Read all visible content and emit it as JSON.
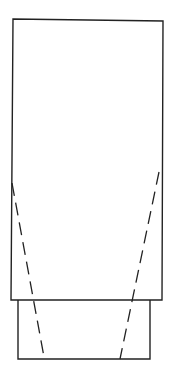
{
  "figure": {
    "width": 172,
    "height": 376,
    "background": "#ffffff",
    "stroke_color": "#222222",
    "upper_body": {
      "points": "13,19 163,21 162,300 11,300"
    },
    "lower_base": {
      "points": "18,300 18,359 150,359 150,300"
    },
    "dashed_lines": [
      {
        "x1": 12,
        "y1": 183,
        "x2": 44,
        "y2": 357
      },
      {
        "x1": 159,
        "y1": 172,
        "x2": 120,
        "y2": 359
      }
    ]
  }
}
